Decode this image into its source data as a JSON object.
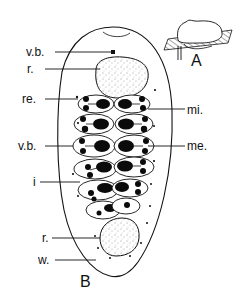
{
  "figure": {
    "panels": [
      {
        "id": "A",
        "label": "A",
        "description": "inset side view of gall on host tissue"
      },
      {
        "id": "B",
        "label": "B",
        "description": "longitudinal view with labeled structures"
      }
    ],
    "labels": {
      "vb_top": "v.b.",
      "r_top": "r.",
      "re": "re.",
      "mi": "mi.",
      "vb_mid": "v.b.",
      "me": "me.",
      "i": "i",
      "r_bottom": "r.",
      "w": "w."
    },
    "colors": {
      "ink": "#111111",
      "background": "#ffffff"
    }
  }
}
